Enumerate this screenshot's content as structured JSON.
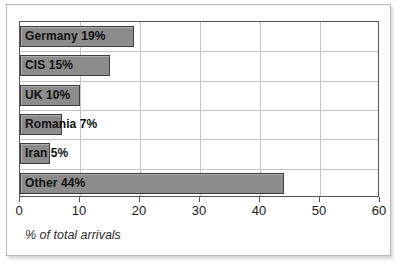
{
  "chart_data": {
    "type": "bar",
    "orientation": "horizontal",
    "title": "",
    "xlabel": "% of total arrivals",
    "ylabel": "",
    "categories": [
      "Germany",
      "CIS",
      "UK",
      "Romania",
      "Iran",
      "Other"
    ],
    "values": [
      19,
      15,
      10,
      7,
      5,
      44
    ],
    "bar_labels": [
      "Germany 19%",
      "CIS 15%",
      "UK 10%",
      "Romania 7%",
      "Iran 5%",
      "Other 44%"
    ],
    "xlim": [
      0,
      60
    ],
    "xticks": [
      0,
      10,
      20,
      30,
      40,
      50,
      60
    ],
    "xtick_labels": [
      "0",
      "10",
      "20",
      "30",
      "40",
      "50",
      "60"
    ],
    "grid": true,
    "legend": "none",
    "colors": {
      "bar_fill": "#8c8c8c",
      "bar_border": "#3d3d3d",
      "gridline": "#c4c4c4",
      "axis": "#555555",
      "plot_background": "#ffffff",
      "frame_border": "#b9b9b9",
      "label_text": "#101010"
    }
  }
}
